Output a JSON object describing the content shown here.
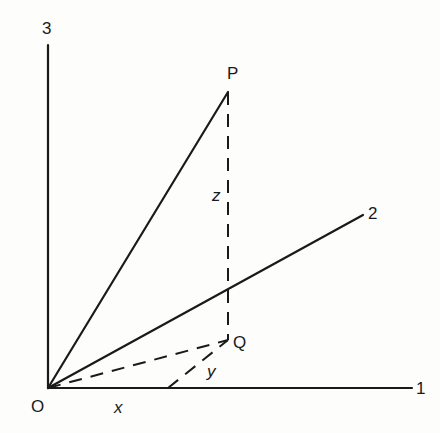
{
  "diagram": {
    "type": "3d-coordinate-projection",
    "colors": {
      "background": "#fdfdfc",
      "ink": "#1a1a1a"
    },
    "labels": {
      "origin": "O",
      "axis1": "1",
      "axis2": "2",
      "axis3": "3",
      "point_p": "P",
      "point_q": "Q",
      "x": "x",
      "y": "y",
      "z": "z"
    },
    "points": {
      "O": [
        48,
        388
      ],
      "P": [
        228,
        92
      ],
      "Q": [
        228,
        340
      ],
      "axis1_end": [
        412,
        388
      ],
      "axis2_end": [
        363,
        215
      ],
      "axis3_end": [
        48,
        45
      ],
      "x_foot": [
        168,
        388
      ]
    },
    "segments": [
      {
        "name": "axis-1",
        "from": "O",
        "to": "axis1_end",
        "style": "solid"
      },
      {
        "name": "axis-2",
        "from": "O",
        "to": "axis2_end",
        "style": "solid"
      },
      {
        "name": "axis-3",
        "from": "O",
        "to": "axis3_end",
        "style": "solid"
      },
      {
        "name": "op-vector",
        "from": "O",
        "to": "P",
        "style": "solid"
      },
      {
        "name": "pq-z-component",
        "from": "P",
        "to": "Q",
        "style": "dashed"
      },
      {
        "name": "oq-projection",
        "from": "O",
        "to": "Q",
        "style": "dashed"
      },
      {
        "name": "y-component",
        "from": "x_foot",
        "to": "Q",
        "style": "dashed"
      }
    ]
  }
}
